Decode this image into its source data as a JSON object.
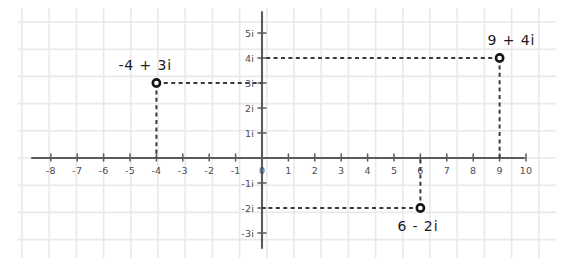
{
  "chart_data": {
    "type": "scatter",
    "title": "",
    "subtitle": "",
    "xlabel": "",
    "ylabel": "",
    "xlim": [
      -8.6,
      10.6
    ],
    "ylim": [
      -3.6,
      5.4
    ],
    "grid": true,
    "legend": "none",
    "style": "hand-drawn graph paper",
    "x_tick_labels": [
      "-8",
      "-7",
      "-6",
      "-5",
      "-4",
      "-3",
      "-2",
      "-1",
      "0",
      "1",
      "2",
      "3",
      "4",
      "5",
      "6",
      "7",
      "8",
      "9",
      "10"
    ],
    "x_tick_values": [
      -8,
      -7,
      -6,
      -5,
      -4,
      -3,
      -2,
      -1,
      0,
      1,
      2,
      3,
      4,
      5,
      6,
      7,
      8,
      9,
      10
    ],
    "y_tick_labels": [
      "5i",
      "4i",
      "3i",
      "2i",
      "1i",
      "-1i",
      "-2i",
      "-3i"
    ],
    "y_tick_values": [
      5,
      4,
      3,
      2,
      1,
      -1,
      -2,
      -3
    ],
    "origin_label": "0",
    "points": [
      {
        "label": "-4 + 3i",
        "x": -4,
        "y": 3,
        "label_dx": -38,
        "label_dy": -13
      },
      {
        "label": "9 + 4i",
        "x": 9,
        "y": 4,
        "label_dx": -12,
        "label_dy": -13
      },
      {
        "label": "6 - 2i",
        "x": 6,
        "y": -2,
        "label_dx": -23,
        "label_dy": 23
      }
    ],
    "colors": {
      "background": "#ffffff",
      "grid": "#e9e9ea",
      "axis": "#5b5b5f",
      "connector": "#3a3a3e",
      "marker_stroke": "#16161a",
      "marker_fill": "#ffffff",
      "tick_text": "#4c4c51",
      "label_text": "#1b1b1f"
    }
  }
}
